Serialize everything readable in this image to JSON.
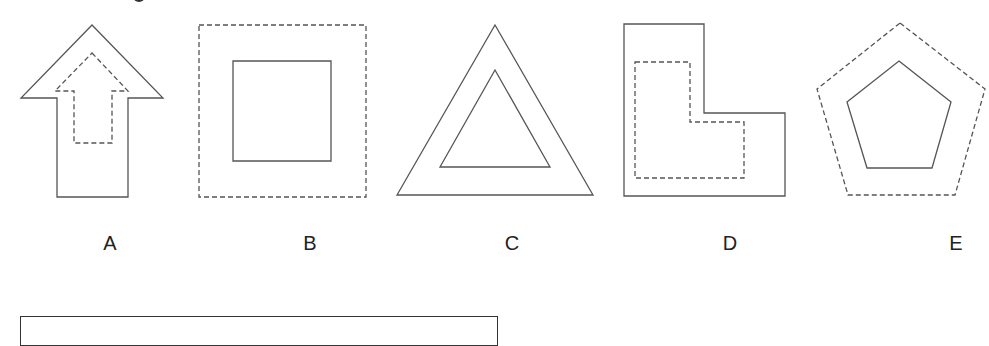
{
  "diagram": {
    "stroke_color": "#555555",
    "background": "#ffffff",
    "figures": [
      {
        "id": "A",
        "label": "A",
        "label_x": 57,
        "outer": {
          "shape": "up-arrow",
          "style": "solid",
          "points": "92,25 163,98 128,98 128,197 57,197 57,98 21,98"
        },
        "inner": {
          "shape": "up-arrow",
          "style": "dashed",
          "points": "92,53 128,91 112,91 112,143 74,143 74,91 55,91"
        }
      },
      {
        "id": "B",
        "label": "B",
        "label_x": 310,
        "outer": {
          "shape": "square",
          "style": "dashed",
          "points": "199,25 366,25 366,197 199,197"
        },
        "inner": {
          "shape": "square",
          "style": "solid",
          "points": "233,61 331,61 331,161 233,161"
        }
      },
      {
        "id": "C",
        "label": "C",
        "label_x": 512,
        "outer": {
          "shape": "triangle",
          "style": "solid",
          "points": "495,25 593,195 397,195"
        },
        "inner": {
          "shape": "triangle",
          "style": "solid",
          "points": "495,70 550,167 440,167"
        }
      },
      {
        "id": "D",
        "label": "D",
        "label_x": 730,
        "outer": {
          "shape": "L-shape",
          "style": "solid",
          "points": "624,24 704,24 704,113 785,113 785,196 624,196"
        },
        "inner": {
          "shape": "L-shape",
          "style": "dashed",
          "points": "635,62 690,62 690,122 744,122 744,178 635,178"
        }
      },
      {
        "id": "E",
        "label": "E",
        "label_x": 956,
        "outer": {
          "shape": "pentagon",
          "style": "dashed",
          "points": "900,23 985,89 955,195 848,195 817,89"
        },
        "inner": {
          "shape": "pentagon",
          "style": "solid",
          "points": "899,61 951,102 932,168 867,168 847,102"
        }
      }
    ]
  }
}
